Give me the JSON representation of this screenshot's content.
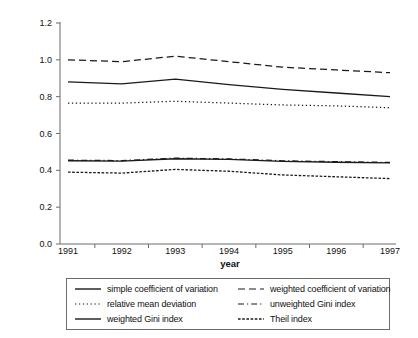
{
  "chart_data": {
    "type": "line",
    "title": "",
    "xlabel": "year",
    "ylabel": "inequality measure",
    "x": [
      1991,
      1992,
      1993,
      1994,
      1995,
      1996,
      1997
    ],
    "xtick_labels": [
      "1991",
      "1992",
      "1993",
      "1994",
      "1995",
      "1996",
      "1997"
    ],
    "ytick_labels": [
      "0.0",
      "0.2",
      "0.4",
      "0.6",
      "0.8",
      "1.0",
      "1.2"
    ],
    "ytick_values": [
      0.0,
      0.2,
      0.4,
      0.6,
      0.8,
      1.0,
      1.2
    ],
    "ylim": [
      0.0,
      1.2
    ],
    "xlim": [
      1991,
      1997
    ],
    "grid": false,
    "legend_position": "below",
    "legend_columns": 2,
    "line_color": "#1a1a1a",
    "series": [
      {
        "name": "simple coefficient of variation",
        "style": "solid",
        "values": [
          0.88,
          0.87,
          0.895,
          0.865,
          0.84,
          0.82,
          0.8
        ]
      },
      {
        "name": "weighted coefficient of variation",
        "style": "dashed",
        "values": [
          1.0,
          0.99,
          1.02,
          0.99,
          0.96,
          0.945,
          0.93
        ]
      },
      {
        "name": "relative mean deviation",
        "style": "dotted",
        "values": [
          0.765,
          0.765,
          0.775,
          0.765,
          0.755,
          0.75,
          0.74
        ]
      },
      {
        "name": "unweighted Gini index",
        "style": "dash-dot",
        "values": [
          0.455,
          0.453,
          0.466,
          0.462,
          0.452,
          0.447,
          0.443
        ]
      },
      {
        "name": "weighted Gini index",
        "style": "solid",
        "values": [
          0.452,
          0.45,
          0.463,
          0.459,
          0.449,
          0.444,
          0.44
        ]
      },
      {
        "name": "Theil index",
        "style": "short-dash",
        "values": [
          0.39,
          0.385,
          0.405,
          0.395,
          0.375,
          0.365,
          0.355
        ]
      }
    ]
  },
  "legend": {
    "entries": [
      {
        "label": "simple coefficient of variation",
        "style": "solid"
      },
      {
        "label": "weighted coefficient of variation",
        "style": "dashed"
      },
      {
        "label": "relative mean deviation",
        "style": "dotted"
      },
      {
        "label": "unweighted Gini index",
        "style": "dash-dot"
      },
      {
        "label": "weighted Gini index",
        "style": "solid"
      },
      {
        "label": "Theil index",
        "style": "short-dash"
      }
    ]
  }
}
